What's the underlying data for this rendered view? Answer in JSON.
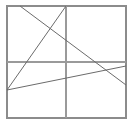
{
  "figure": {
    "background_color": "#ffffff",
    "width": 133,
    "height": 126,
    "frame": {
      "name": "outer-square-border",
      "color": "#8c8c8c",
      "stroke_width": 1.1,
      "x_min": 7,
      "y_min": 6,
      "x_max": 126,
      "y_max": 118
    },
    "grid": {
      "color": "#9a9a9a",
      "stroke_width": 1.1,
      "horizontal": [
        {
          "name": "horizontal-gridline",
          "y": 62,
          "x_start": 7,
          "x_end": 126
        }
      ],
      "vertical": [
        {
          "name": "vertical-gridline",
          "x": 66,
          "y_start": 6,
          "y_end": 118
        }
      ]
    },
    "lines": [
      {
        "name": "descending-diagonal",
        "description": "from upper-left top edge down to right edge",
        "color": "#6b6b6b",
        "stroke_width": 1.0,
        "x1": 20,
        "y1": 6,
        "x2": 126,
        "y2": 85
      },
      {
        "name": "steep-ascending-diagonal",
        "description": "from lower-left vertex up to top edge at vertical gridline",
        "color": "#6b6b6b",
        "stroke_width": 1.0,
        "x1": 7,
        "y1": 90,
        "x2": 66,
        "y2": 6
      },
      {
        "name": "shallow-ascending-diagonal",
        "description": "from lower-left vertex rising gently to right edge",
        "color": "#6b6b6b",
        "stroke_width": 1.0,
        "x1": 7,
        "y1": 90,
        "x2": 126,
        "y2": 66
      }
    ],
    "vertices": [
      {
        "name": "lower-left-vertex",
        "x": 7,
        "y": 90
      },
      {
        "name": "upper-crossing-point",
        "x": 52,
        "y": 33
      },
      {
        "name": "right-crossing-point",
        "x": 107,
        "y": 68
      }
    ]
  }
}
